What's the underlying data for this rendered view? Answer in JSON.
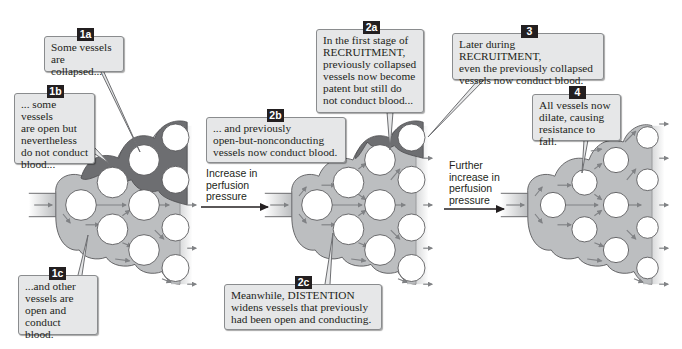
{
  "colors": {
    "collapsed_vessel": "#6d6e71",
    "open_vessel": "#bcbec0",
    "flow_arrow": "#808285",
    "capillary_fill": "#ffffff",
    "callout_bg": "#e6e7e8",
    "badge_bg": "#231f20"
  },
  "callouts": {
    "c1a": {
      "badge": "1a",
      "text": "Some vessels\nare collapsed..."
    },
    "c1b": {
      "badge": "1b",
      "text": "... some vessels\nare open but\nnevertheless\ndo not conduct\nblood..."
    },
    "c1c": {
      "badge": "1c",
      "text": "...and other\nvessels are\nopen and\nconduct blood."
    },
    "c2a": {
      "badge": "2a",
      "text": "In the first stage of\nRECRUITMENT,\npreviously collapsed\nvessels now become\npatent but still do\nnot conduct blood..."
    },
    "c2b": {
      "badge": "2b",
      "text": "... and previously\nopen-but-nonconducting\nvessels now conduct blood."
    },
    "c2c": {
      "badge": "2c",
      "text": "Meanwhile, DISTENTION\nwidens vessels that previously\nhad been open and conducting."
    },
    "c3": {
      "badge": "3",
      "text": "Later during RECRUITMENT,\neven the previously collapsed\nvessels now conduct blood."
    },
    "c4": {
      "badge": "4",
      "text": "All vessels now\ndilate, causing\nresistance to fall."
    }
  },
  "transitions": {
    "t1": {
      "label": "Increase in\nperfusion\npressure"
    },
    "t2": {
      "label": "Further\nincrease in\nperfusion\npressure"
    }
  }
}
